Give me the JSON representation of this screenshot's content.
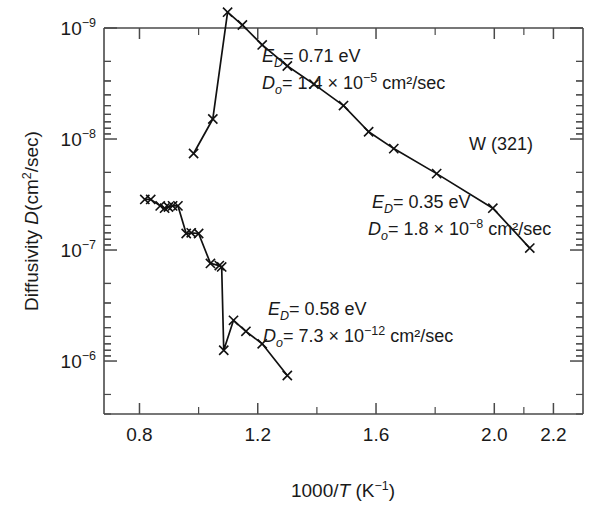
{
  "chart_data": {
    "type": "line",
    "title": "",
    "subtitle": "",
    "xlabel": "1000/T (K⁻¹)",
    "ylabel": "Diffusivity D(cm²/sec)",
    "xlim": [
      0.68,
      2.3
    ],
    "ylim_log_inverted": [
      1e-09,
      3e-06
    ],
    "y_axis_inverted": true,
    "y_scale": "log",
    "grid": false,
    "legend_position": "none",
    "sample_label": "W (321)",
    "x_ticks_major": [
      "0.8",
      "1.2",
      "1.6",
      "2.0",
      "2.2"
    ],
    "x_tick_major_values": [
      0.8,
      1.2,
      1.6,
      2.0,
      2.2
    ],
    "x_tick_minor_values": [
      1.0,
      1.4,
      1.8,
      2.1
    ],
    "y_ticks_major": [
      "10⁻⁹",
      "10⁻⁸",
      "10⁻⁷",
      "10⁻⁶"
    ],
    "y_tick_major_values": [
      1e-09,
      1e-08,
      1e-07,
      1e-06
    ],
    "series": [
      {
        "name": "upper-branch",
        "marker": "x",
        "points": [
          [
            0.983,
            1.35e-08
          ],
          [
            1.048,
            6.6e-09
          ],
          [
            1.098,
            7.2e-10
          ],
          [
            1.148,
            9.4e-10
          ],
          [
            1.215,
            1.42e-09
          ],
          [
            1.3,
            2.2e-09
          ],
          [
            1.39,
            3.2e-09
          ],
          [
            1.49,
            5e-09
          ],
          [
            1.575,
            8.6e-09
          ],
          [
            1.66,
            1.22e-08
          ],
          [
            1.805,
            2.05e-08
          ],
          [
            1.995,
            4.2e-08
          ],
          [
            2.12,
            9.6e-08
          ]
        ]
      },
      {
        "name": "lower-branch",
        "marker": "x",
        "points": [
          [
            0.818,
            3.5e-08
          ],
          [
            0.838,
            3.5e-08
          ],
          [
            0.87,
            4e-08
          ],
          [
            0.885,
            4.2e-08
          ],
          [
            0.898,
            4.1e-08
          ],
          [
            0.912,
            4e-08
          ],
          [
            0.93,
            4e-08
          ],
          [
            0.958,
            7.1e-08
          ],
          [
            0.975,
            7e-08
          ],
          [
            1.0,
            7.1e-08
          ],
          [
            1.04,
            1.32e-07
          ],
          [
            1.07,
            1.38e-07
          ],
          [
            1.078,
            1.42e-07
          ],
          [
            1.085,
            8e-07
          ],
          [
            1.118,
            4.3e-07
          ],
          [
            1.16,
            5.4e-07
          ],
          [
            1.215,
            7e-07
          ],
          [
            1.3,
            1.35e-06
          ]
        ]
      }
    ],
    "annotations": [
      {
        "id": "segment-1",
        "energy_label": "E",
        "energy_sub": "D",
        "energy_value": "= 0.71 eV",
        "prefactor_label": "D",
        "prefactor_sub": "o",
        "prefactor_value": "= 1.4 × 10",
        "prefactor_exp": "−5",
        "prefactor_unit": "cm²/sec"
      },
      {
        "id": "segment-2",
        "energy_label": "E",
        "energy_sub": "D",
        "energy_value": "= 0.35 eV",
        "prefactor_label": "D",
        "prefactor_sub": "o",
        "prefactor_value": "= 1.8 × 10",
        "prefactor_exp": "−8",
        "prefactor_unit": "cm²/sec"
      },
      {
        "id": "segment-3",
        "energy_label": "E",
        "energy_sub": "D",
        "energy_value": "= 0.58 eV",
        "prefactor_label": "D",
        "prefactor_sub": "o",
        "prefactor_value": "= 7.3 × 10",
        "prefactor_exp": "−12",
        "prefactor_unit": "cm²/sec"
      }
    ]
  },
  "axes": {
    "y_label_main": "Diffusivity ",
    "y_label_d": "D",
    "y_label_rest": "(cm",
    "y_label_sup": "2",
    "y_label_tail": "/sec)",
    "x_label_pre": "1000/",
    "x_label_t": "T",
    "x_label_unit": " (K",
    "x_label_unit_sup": "−1",
    "x_label_unit_tail": ")"
  },
  "ytick_labels": [
    {
      "base": "10",
      "exp": "−9"
    },
    {
      "base": "10",
      "exp": "−8"
    },
    {
      "base": "10",
      "exp": "−7"
    },
    {
      "base": "10",
      "exp": "−6"
    }
  ],
  "sample": {
    "label": "W (321)"
  }
}
